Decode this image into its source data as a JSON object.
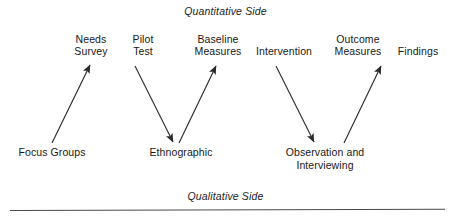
{
  "figure": {
    "caption_top": "Quantitative Side",
    "caption_bottom": "Qualitative Side",
    "line_color": "#2b2b2b",
    "text_color": "#181818",
    "rule_color": "#4a4a4a"
  },
  "nodes": {
    "quantitative": [
      {
        "id": "needs-survey",
        "label": "Needs\nSurvey",
        "x": 64,
        "width": 54
      },
      {
        "id": "pilot-test",
        "label": "Pilot\nTest",
        "x": 122,
        "width": 42
      },
      {
        "id": "baseline-measures",
        "label": "Baseline\nMeasures",
        "x": 185,
        "width": 66
      },
      {
        "id": "intervention",
        "label": "Intervention",
        "x": 251,
        "width": 66
      },
      {
        "id": "outcome-measures",
        "label": "Outcome\nMeasures",
        "x": 325,
        "width": 66
      },
      {
        "id": "findings",
        "label": "Findings",
        "x": 392,
        "width": 52
      }
    ],
    "qualitative": [
      {
        "id": "focus-groups",
        "label": "Focus Groups",
        "x": 10,
        "width": 84
      },
      {
        "id": "ethnographic",
        "label": "Ethnographic",
        "x": 141,
        "width": 80
      },
      {
        "id": "observation-interviewing",
        "label": "Observation and\nInterviewing",
        "x": 275,
        "width": 100
      }
    ]
  },
  "arrows": [
    {
      "id": "focus-groups-to-needs-survey",
      "from": "focus-groups",
      "to": "needs-survey",
      "direction": "up",
      "x1": 52,
      "y1": 143,
      "x2": 90,
      "y2": 65
    },
    {
      "id": "pilot-test-to-ethnographic",
      "from": "pilot-test",
      "to": "ethnographic",
      "direction": "down",
      "x1": 135,
      "y1": 66,
      "x2": 173,
      "y2": 142
    },
    {
      "id": "ethnographic-to-baseline-measures",
      "from": "ethnographic",
      "to": "baseline-measures",
      "direction": "up",
      "x1": 179,
      "y1": 143,
      "x2": 216,
      "y2": 66
    },
    {
      "id": "intervention-to-observation",
      "from": "intervention",
      "to": "observation-interviewing",
      "direction": "down",
      "x1": 276,
      "y1": 66,
      "x2": 314,
      "y2": 142
    },
    {
      "id": "observation-to-outcome-measures",
      "from": "observation-interviewing",
      "to": "outcome-measures",
      "direction": "up",
      "x1": 344,
      "y1": 143,
      "x2": 381,
      "y2": 66
    }
  ]
}
